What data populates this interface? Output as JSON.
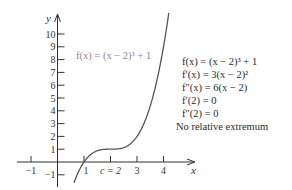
{
  "chart_data": {
    "type": "line",
    "title": "",
    "xlabel": "x",
    "ylabel": "y",
    "xlim": [
      -1.5,
      5.3
    ],
    "ylim": [
      -1.9,
      11.5
    ],
    "x_ticks": [
      -1,
      1,
      2,
      3,
      4
    ],
    "x_tick_labels": [
      "-1",
      "1",
      "c = 2",
      "3",
      "4"
    ],
    "y_ticks": [
      -1,
      1,
      2,
      3,
      4,
      5,
      6,
      7,
      8,
      9,
      10
    ],
    "y_tick_labels": [
      "-1",
      "1",
      "2",
      "3",
      "4",
      "5",
      "6",
      "7",
      "8",
      "9",
      "10"
    ],
    "grid": false,
    "series": [
      {
        "name": "f(x) = (x − 2)³ + 1",
        "function": "(x-2)^3 + 1",
        "x": [
          0.62,
          1,
          1.5,
          2,
          2.5,
          3,
          3.5,
          4,
          4.2
        ],
        "values": [
          -1.63,
          0,
          0.875,
          1,
          1.125,
          2,
          4.375,
          9,
          11.65
        ]
      }
    ],
    "annotations": [
      "f(x) = (x − 2)³ + 1",
      "f′(x) = 3(x − 2)²",
      "f″(x) = 6(x − 2)",
      "f′(2) = 0",
      "f″(2) = 0",
      "No relative extremum"
    ]
  },
  "graph": {
    "curve_label": "f(x) = (x − 2)³ + 1",
    "x_axis_label": "x",
    "y_axis_label": "y",
    "colors": {
      "curve": "#555555",
      "axis": "#333333",
      "label": "#8a8a8a"
    }
  },
  "notes": {
    "line1": "f(x) = (x − 2)³ + 1",
    "line2": "f′(x) = 3(x − 2)²",
    "line3": "f″(x) = 6(x − 2)",
    "line4": "f′(2) = 0",
    "line5": "f″(2) = 0",
    "line6": "No relative extremum"
  }
}
